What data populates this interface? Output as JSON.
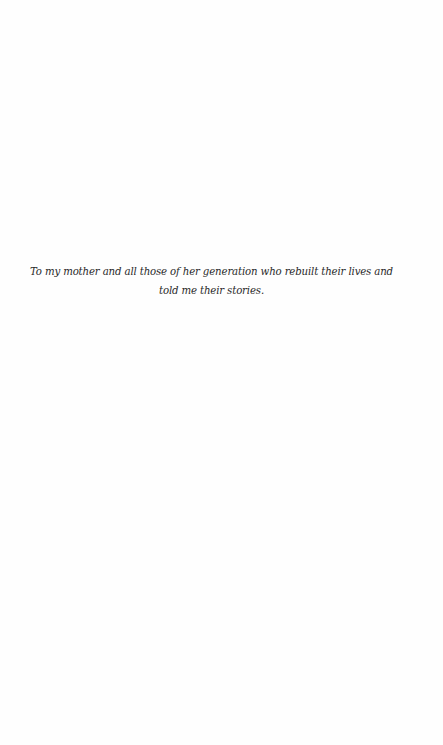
{
  "page": {
    "type": "dedication",
    "background_color": "#fefefe",
    "text_color": "#2a2a2a"
  },
  "dedication": {
    "lines": [
      "To my mother and all those of her generation who rebuilt their lives and",
      "told me their stories."
    ]
  }
}
